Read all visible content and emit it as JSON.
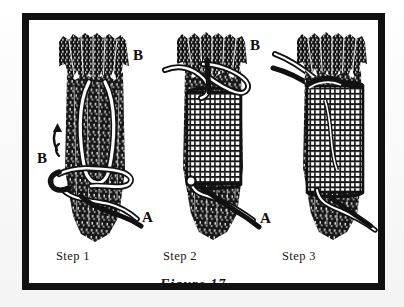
{
  "figure": {
    "caption": "Figure 17",
    "background_color": "#ffffff",
    "ink_color": "#111111",
    "page_color": "#fbfbfb",
    "frame_color": "#111111"
  },
  "panels": [
    {
      "id": "step-1",
      "step_label": "Step 1",
      "description": "Bundle of sticks with a loop of cord laid along the shaft, loose end emerging at the bottom",
      "labels": [
        {
          "text": "B",
          "role": "standing-end-label",
          "position": "left-middle"
        },
        {
          "text": "A",
          "role": "working-end-label",
          "position": "bottom-right"
        }
      ],
      "arrow": {
        "present": true,
        "direction": "up-left",
        "role": "pull-direction-arrow"
      }
    },
    {
      "id": "step-2",
      "step_label": "Step 2",
      "description": "Cord wrapped in tight coils around the bundle forming the whipping",
      "labels": [
        {
          "text": "B",
          "role": "standing-end-label",
          "position": "top-left"
        },
        {
          "text": "A",
          "role": "working-end-label",
          "position": "bottom-right"
        }
      ],
      "arrow": {
        "present": false,
        "direction": "",
        "role": ""
      }
    },
    {
      "id": "step-3",
      "step_label": "Step 3",
      "description": "Completed whipping with both ends drawn tight under the coils",
      "labels": [
        {
          "text": "B",
          "role": "standing-end-label",
          "position": "top-left-outside"
        },
        {
          "text": "A",
          "role": "working-end-label",
          "position": "bottom-right"
        }
      ],
      "arrow": {
        "present": false,
        "direction": "",
        "role": ""
      }
    }
  ]
}
